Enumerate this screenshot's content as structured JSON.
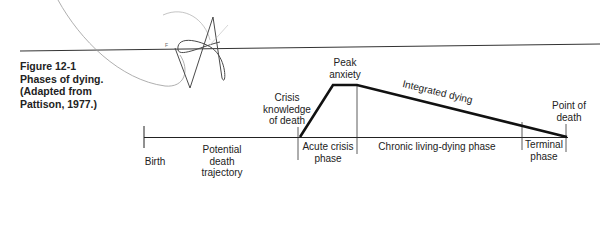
{
  "figure": {
    "number": "Figure 12-1",
    "title": "Phases of dying.",
    "source_line1": "(Adapted from",
    "source_line2": "Pattison, 1977.)"
  },
  "diagram": {
    "points": {
      "birth": "Birth",
      "crisis_line1": "Crisis",
      "crisis_line2": "knowledge",
      "crisis_line3": "of death",
      "peak_line1": "Peak",
      "peak_line2": "anxiety",
      "death_line1": "Point of",
      "death_line2": "death"
    },
    "curve_label": "Integrated dying",
    "phases": {
      "potential_line1": "Potential",
      "potential_line2": "death",
      "potential_line3": "trajectory",
      "acute_line1": "Acute crisis",
      "acute_line2": "phase",
      "chronic": "Chronic living-dying phase",
      "terminal_line1": "Terminal",
      "terminal_line2": "phase"
    },
    "colors": {
      "ink": "#1a1a1a",
      "scribble": "#555555",
      "faint": "#9a9a9a"
    }
  }
}
